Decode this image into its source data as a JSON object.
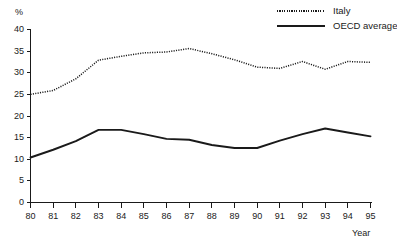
{
  "chart_data": {
    "type": "line",
    "title": "",
    "subtitle": "",
    "xlabel": "Year",
    "ylabel": "%",
    "categories": [
      "80",
      "81",
      "82",
      "83",
      "84",
      "85",
      "86",
      "87",
      "88",
      "89",
      "90",
      "91",
      "92",
      "93",
      "94",
      "95"
    ],
    "x": [
      1980,
      1981,
      1982,
      1983,
      1984,
      1985,
      1986,
      1987,
      1988,
      1989,
      1990,
      1991,
      1992,
      1993,
      1994,
      1995
    ],
    "xlim": [
      1980,
      1995
    ],
    "ylim": [
      0,
      40
    ],
    "yticks": [
      0,
      5,
      10,
      15,
      20,
      25,
      30,
      35,
      40
    ],
    "xticks": [
      "80",
      "81",
      "82",
      "83",
      "84",
      "85",
      "86",
      "87",
      "88",
      "89",
      "90",
      "91",
      "92",
      "93",
      "94",
      "95"
    ],
    "grid": false,
    "legend_position": "top-right",
    "series": [
      {
        "name": "Italy",
        "style": "dotted",
        "color": "#1a1a1a",
        "values": [
          25.0,
          25.9,
          28.6,
          32.9,
          33.8,
          34.6,
          34.8,
          35.6,
          34.4,
          33.0,
          31.3,
          31.0,
          32.6,
          30.8,
          32.6,
          32.4
        ]
      },
      {
        "name": "OECD average",
        "style": "solid",
        "color": "#1a1a1a",
        "values": [
          10.4,
          12.2,
          14.2,
          16.8,
          16.8,
          15.8,
          14.7,
          14.5,
          13.3,
          12.6,
          12.6,
          14.3,
          15.8,
          17.1,
          16.2,
          15.3
        ]
      }
    ],
    "legend": [
      {
        "label": "Italy",
        "style": "dotted"
      },
      {
        "label": "OECD average",
        "style": "solid"
      }
    ]
  },
  "axes": {
    "y_unit_label": "%",
    "x_title": "Year"
  }
}
